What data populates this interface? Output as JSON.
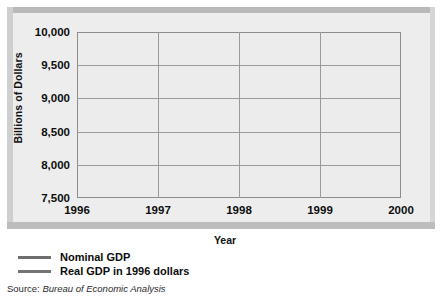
{
  "chart_data": {
    "type": "line",
    "title": "",
    "xlabel": "Year",
    "ylabel": "Billions of Dollars",
    "x": [
      1996,
      1997,
      1998,
      1999,
      2000
    ],
    "categories": [
      "1996",
      "1997",
      "1998",
      "1999",
      "2000"
    ],
    "xtick_labels": [
      "1996",
      "1997",
      "1998",
      "1999",
      "2000"
    ],
    "ytick_labels": [
      "10,000",
      "9,500",
      "9,000",
      "8,500",
      "8,000",
      "7,500"
    ],
    "ytick_values": [
      10000,
      9500,
      9000,
      8500,
      8000,
      7500
    ],
    "ylim": [
      7500,
      10000
    ],
    "xlim": [
      1996,
      2000
    ],
    "grid": true,
    "legend_position": "below-left",
    "series": [
      {
        "name": "Nominal GDP",
        "color": "#6e6e6e",
        "values": [
          7850,
          8350,
          8850,
          9400,
          9950
        ]
      },
      {
        "name": "Real GDP in 1996 dollars",
        "color": "#747474",
        "values": [
          7850,
          8200,
          8550,
          8900,
          9270
        ]
      }
    ]
  },
  "axes": {
    "y_title": "Billions of Dollars",
    "x_title": "Year"
  },
  "legend": {
    "items": [
      {
        "label": "Nominal GDP",
        "color": "#6e6e6e"
      },
      {
        "label": "Real GDP in 1996 dollars",
        "color": "#747474"
      }
    ]
  },
  "source": {
    "label": "Source:",
    "value": "Bureau of Economic Analysis"
  },
  "colors": {
    "frame_fill": "#e9e9e9",
    "plot_fill": "#ececec",
    "grid": "#9a9a9a",
    "axis": "#8d8d8d",
    "text": "#0d0d0d"
  }
}
